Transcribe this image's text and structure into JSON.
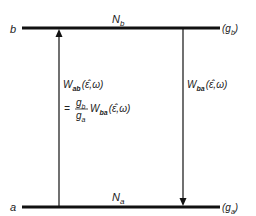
{
  "diagram": {
    "upper_level": {
      "label": "b",
      "population": "N",
      "population_sub": "b",
      "degeneracy": "(g",
      "degeneracy_sub": "b",
      "degeneracy_close": ")"
    },
    "lower_level": {
      "label": "a",
      "population": "N",
      "population_sub": "a",
      "degeneracy": "(g",
      "degeneracy_sub": "a",
      "degeneracy_close": ")"
    },
    "absorption": {
      "symbol": "W",
      "sub": "ab",
      "args": "(ε̂,ω)",
      "eq": "=",
      "frac_num": "g",
      "frac_num_sub": "b",
      "frac_den": "g",
      "frac_den_sub": "a",
      "rhs_symbol": "W",
      "rhs_sub": "ba",
      "rhs_args": "(ε̂,ω)"
    },
    "emission": {
      "symbol": "W",
      "sub": "ba",
      "args": "(ε̂,ω)"
    }
  }
}
